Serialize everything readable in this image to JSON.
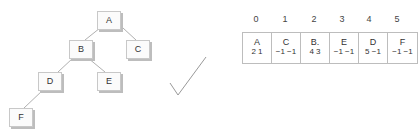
{
  "tree": {
    "nodes": [
      {
        "id": "A",
        "label": "A",
        "x": 97,
        "y": 11
      },
      {
        "id": "B",
        "label": "B",
        "x": 69,
        "y": 40
      },
      {
        "id": "C",
        "label": "C",
        "x": 126,
        "y": 40
      },
      {
        "id": "D",
        "label": "D",
        "x": 38,
        "y": 72
      },
      {
        "id": "E",
        "label": "E",
        "x": 97,
        "y": 72
      },
      {
        "id": "F",
        "label": "F",
        "x": 9,
        "y": 108
      }
    ],
    "edges": [
      [
        "A",
        "B"
      ],
      [
        "A",
        "C"
      ],
      [
        "B",
        "D"
      ],
      [
        "B",
        "E"
      ],
      [
        "D",
        "F"
      ]
    ]
  },
  "array": {
    "indices": [
      "0",
      "1",
      "2",
      "3",
      "4",
      "5"
    ],
    "cells": [
      {
        "value": "A",
        "left": "2",
        "right": "1"
      },
      {
        "value": "C",
        "left": "−1",
        "right": "−1"
      },
      {
        "value": "B.",
        "left": "4",
        "right": "3"
      },
      {
        "value": "E",
        "left": "−1",
        "right": "−1"
      },
      {
        "value": "D",
        "left": "5",
        "right": "−1"
      },
      {
        "value": "F",
        "left": "−1",
        "right": "−1"
      }
    ]
  },
  "annotation": {
    "checkmark-icon": "check"
  }
}
